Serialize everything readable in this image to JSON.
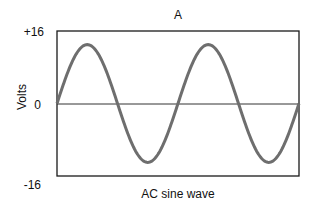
{
  "chart_data": {
    "type": "line",
    "title": "A",
    "xlabel": "AC sine wave",
    "ylabel": "Volts",
    "yticks": [
      "+16",
      "0",
      "-16"
    ],
    "ylim": [
      -16,
      16
    ],
    "xlim": [
      0,
      2
    ],
    "grid": false,
    "legend": null,
    "series": [
      {
        "name": "AC sine wave",
        "color": "#6e6e6e",
        "cycles": 2,
        "amplitude": 16,
        "peak_value": 13,
        "x": [
          0,
          0.25,
          0.5,
          0.75,
          1.0,
          1.25,
          1.5,
          1.75,
          2.0
        ],
        "values": [
          0,
          13,
          0,
          -13,
          0,
          13,
          0,
          -13,
          0
        ]
      }
    ],
    "zero_line": true
  },
  "labels": {
    "title": "A",
    "xlabel": "AC sine wave",
    "ylabel": "Volts",
    "ytick_top": "+16",
    "ytick_mid": "0",
    "ytick_bottom": "-16"
  }
}
